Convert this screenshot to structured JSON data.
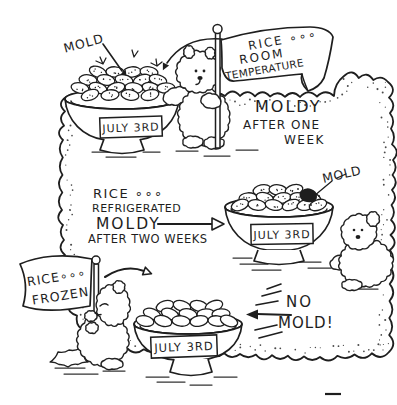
{
  "illustration": {
    "ink_color": "#1e1e1e",
    "paper_color": "#ffffff",
    "room_temperature": {
      "mold_callout": "MOLD",
      "flag_line1": "RICE ∘∘∘",
      "flag_line2": "ROOM",
      "flag_line3": "TEMPERATURE",
      "result_line1": "MOLDY",
      "result_line2": "AFTER ONE",
      "result_line3": "WEEK",
      "bowl_label": "JULY 3RD"
    },
    "refrigerated": {
      "caption_line1": "RICE ∘∘∘",
      "caption_line2": "REFRIGERATED",
      "caption_line3": "MOLDY",
      "caption_line4": "AFTER TWO WEEKS",
      "mold_callout": "MOLD",
      "bowl_label": "JULY 3RD"
    },
    "frozen": {
      "flag_line1": "RICE∘∘∘",
      "flag_line2": "FROZEN",
      "result_line1": "NO",
      "result_line2": "MOLD!",
      "bowl_label": "JULY 3RD"
    }
  }
}
